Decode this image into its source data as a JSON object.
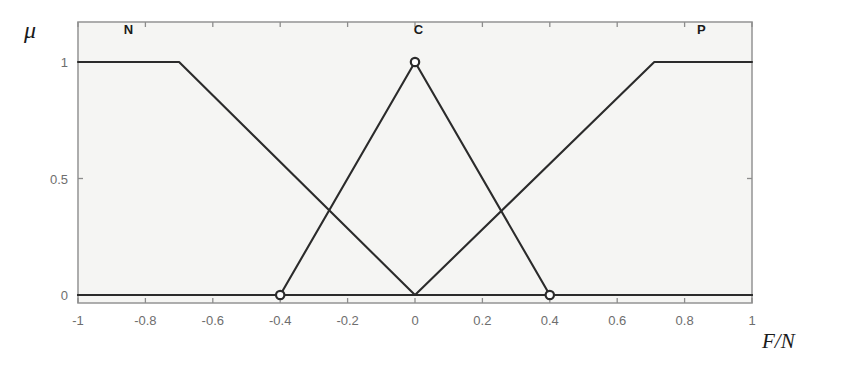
{
  "figure": {
    "mu_symbol": "μ",
    "x_axis_label": "F/N",
    "background_color": "#f5f5f3",
    "line_color": "#2b2b2b",
    "frame_color": "#9a9a9a",
    "tick_text_color": "#6e6e6e"
  },
  "chart_data": {
    "type": "line",
    "title": "",
    "subtitle": "",
    "xlabel": "F/N",
    "ylabel": "μ",
    "xlim": [
      -1,
      1
    ],
    "ylim": [
      0,
      1
    ],
    "grid": false,
    "legend_position": "in-plot-top",
    "xticks": [
      -1,
      -0.8,
      -0.6,
      -0.4,
      -0.2,
      0,
      0.2,
      0.4,
      0.6,
      0.8,
      1
    ],
    "xticklabels": [
      "-1",
      "-0.8",
      "-0.6",
      "-0.4",
      "-0.2",
      "0",
      "0.2",
      "0.4",
      "0.6",
      "0.8",
      "1"
    ],
    "yticks": [
      0,
      0.5,
      1
    ],
    "yticklabels": [
      "0",
      "0.5",
      "1"
    ],
    "series": [
      {
        "name": "N",
        "label": "N",
        "label_x": -0.85,
        "label_y": 1.12,
        "x": [
          -1,
          -0.7,
          0,
          1
        ],
        "y": [
          1,
          1,
          0,
          0
        ],
        "markers": []
      },
      {
        "name": "C",
        "label": "C",
        "label_x": 0.01,
        "label_y": 1.12,
        "x": [
          -1,
          -0.4,
          0,
          0.4,
          1
        ],
        "y": [
          0,
          0,
          1,
          0,
          0
        ],
        "markers": [
          {
            "x": -0.4,
            "y": 0
          },
          {
            "x": 0,
            "y": 1
          },
          {
            "x": 0.4,
            "y": 0
          }
        ]
      },
      {
        "name": "P",
        "label": "P",
        "label_x": 0.85,
        "label_y": 1.12,
        "x": [
          -1,
          0,
          0.71,
          1
        ],
        "y": [
          0,
          0,
          1,
          1
        ],
        "markers": []
      }
    ],
    "annotations": [
      {
        "text": "N",
        "x": -0.85,
        "y": 1.12
      },
      {
        "text": "C",
        "x": 0.01,
        "y": 1.12
      },
      {
        "text": "P",
        "x": 0.85,
        "y": 1.12
      }
    ]
  }
}
